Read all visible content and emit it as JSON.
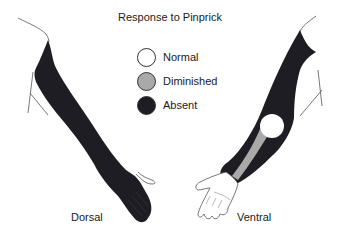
{
  "title": "Response to Pinprick",
  "legend": [
    {
      "label": "Normal",
      "color": "#ffffff"
    },
    {
      "label": "Diminished",
      "color": "#a9a9a9"
    },
    {
      "label": "Absent",
      "color": "#1e1d24"
    }
  ],
  "views": {
    "left": {
      "label": "Dorsal"
    },
    "right": {
      "label": "Ventral"
    }
  },
  "colors": {
    "absent": "#1e1d24",
    "diminished": "#a9a9a9",
    "normal": "#ffffff",
    "outline": "#333333"
  }
}
